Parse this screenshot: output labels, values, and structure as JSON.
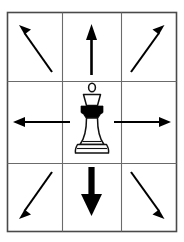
{
  "diagram": {
    "subject_piece": "queen",
    "piece_icon": "chess-queen-icon",
    "grid": {
      "rows": 3,
      "columns": 3,
      "border_color": "#4a4a4a",
      "line_color": "#6b6b6b",
      "background_color": "#ffffff"
    },
    "arrow_color": "#000000",
    "cells": [
      {
        "id": "cell-top-left",
        "row": 0,
        "column": 0,
        "content": "arrow",
        "arrow_icon": "arrow-up-left-icon",
        "direction": "up-left",
        "direction_label": "Northwest",
        "weight": "thin"
      },
      {
        "id": "cell-top-center",
        "row": 0,
        "column": 1,
        "content": "arrow",
        "arrow_icon": "arrow-up-icon",
        "direction": "up",
        "direction_label": "North",
        "weight": "medium"
      },
      {
        "id": "cell-top-right",
        "row": 0,
        "column": 2,
        "content": "arrow",
        "arrow_icon": "arrow-up-right-icon",
        "direction": "up-right",
        "direction_label": "Northeast",
        "weight": "thin"
      },
      {
        "id": "cell-middle-left",
        "row": 1,
        "column": 0,
        "content": "arrow",
        "arrow_icon": "arrow-left-icon",
        "direction": "left",
        "direction_label": "West",
        "weight": "thin"
      },
      {
        "id": "cell-center",
        "row": 1,
        "column": 1,
        "content": "piece",
        "piece_icon": "chess-queen-icon",
        "piece_name": "Queen",
        "direction": "none",
        "direction_label": "Center",
        "weight": "none"
      },
      {
        "id": "cell-middle-right",
        "row": 1,
        "column": 2,
        "content": "arrow",
        "arrow_icon": "arrow-right-icon",
        "direction": "right",
        "direction_label": "East",
        "weight": "thin"
      },
      {
        "id": "cell-bottom-left",
        "row": 2,
        "column": 0,
        "content": "arrow",
        "arrow_icon": "arrow-down-left-icon",
        "direction": "down-left",
        "direction_label": "Southwest",
        "weight": "thin"
      },
      {
        "id": "cell-bottom-center",
        "row": 2,
        "column": 1,
        "content": "arrow",
        "arrow_icon": "arrow-down-icon",
        "direction": "down",
        "direction_label": "South",
        "weight": "thick"
      },
      {
        "id": "cell-bottom-right",
        "row": 2,
        "column": 2,
        "content": "arrow",
        "arrow_icon": "arrow-down-right-icon",
        "direction": "down-right",
        "direction_label": "Southeast",
        "weight": "thin"
      }
    ]
  }
}
